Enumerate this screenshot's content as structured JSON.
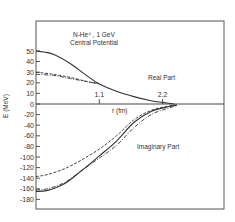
{
  "chart_data": {
    "type": "line",
    "title": "N-He⁴ , 1 GeV",
    "subtitle": "Central Potential",
    "xlabel": "r (fm)",
    "ylabel": "E (MeV)",
    "x_ticks": [
      {
        "value": 1.1,
        "label": "1.1"
      },
      {
        "value": 2.2,
        "label": "2.2"
      }
    ],
    "y_ticks": [
      50,
      40,
      30,
      20,
      10,
      0,
      -20,
      -40,
      -60,
      -80,
      -100,
      -120,
      -140,
      -160,
      -180
    ],
    "y_tick_labels": [
      "50",
      "40",
      "30",
      "20",
      "10",
      "0",
      "-20",
      "-40",
      "-60",
      "-80",
      "-100",
      "-120",
      "-140",
      "-160",
      "-180"
    ],
    "xlim": [
      0,
      3.3
    ],
    "ylim": [
      -195,
      60
    ],
    "grid": false,
    "annotations": [
      {
        "text": "Real Part",
        "x": 2.0,
        "y": 24
      },
      {
        "text": "Imaginary Part",
        "x": 1.8,
        "y": -85
      }
    ],
    "series": [
      {
        "name": "Real Part (solid)",
        "style": "solid",
        "x": [
          0,
          0.3,
          0.6,
          0.9,
          1.1,
          1.4,
          1.7,
          2.0,
          2.2,
          2.4
        ],
        "values": [
          50,
          47,
          38,
          26,
          19,
          12,
          7,
          3,
          1.5,
          0
        ]
      },
      {
        "name": "Real Part (dashed)",
        "style": "dashed",
        "x": [
          0,
          0.3,
          0.6,
          0.9,
          1.1
        ],
        "values": [
          30,
          28,
          25,
          21,
          19
        ]
      },
      {
        "name": "Real Part (dash-dot)",
        "style": "dashdot",
        "x": [
          0,
          0.3,
          0.6,
          0.9,
          1.1
        ],
        "values": [
          28,
          27,
          24,
          21,
          19
        ]
      },
      {
        "name": "Imaginary Part (solid)",
        "style": "solid",
        "x": [
          0,
          0.2,
          0.5,
          0.8,
          1.1,
          1.4,
          1.7,
          2.0,
          2.3,
          2.45
        ],
        "values": [
          -165,
          -163,
          -150,
          -125,
          -98,
          -70,
          -35,
          -14,
          -5,
          -2
        ]
      },
      {
        "name": "Imaginary Part (dashed)",
        "style": "dashed",
        "x": [
          0,
          0.2,
          0.5,
          0.8,
          1.1,
          1.4,
          1.7,
          2.0,
          2.3,
          2.45
        ],
        "values": [
          -137,
          -133,
          -122,
          -105,
          -85,
          -60,
          -30,
          -12,
          -4,
          -2
        ]
      },
      {
        "name": "Imaginary Part (dash-dot)",
        "style": "dashdot",
        "x": [
          0,
          0.2,
          0.5,
          0.8,
          1.1,
          1.4,
          1.7,
          2.0,
          2.3,
          2.45
        ],
        "values": [
          -162,
          -160,
          -148,
          -125,
          -102,
          -78,
          -45,
          -20,
          -8,
          -3
        ]
      }
    ]
  }
}
